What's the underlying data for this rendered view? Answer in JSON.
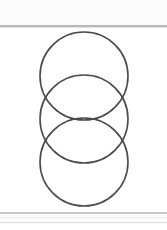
{
  "page": {
    "width": 167,
    "height": 230,
    "background_color": "#ffffff"
  },
  "top_band": {
    "background_color": "#fbfbfb",
    "rule_color": "#b9b9b9"
  },
  "bottom_band": {
    "background_color": "#fcfcfc",
    "rule_color": "#c9c9c9"
  },
  "figure": {
    "title": "",
    "stroke_color": "#4a4a4a",
    "fill": "none",
    "stroke_width": 1.6,
    "shape_count": 3,
    "shapes": [
      {
        "name": "circle-top",
        "type": "circle",
        "cx": 84,
        "cy": 76,
        "r": 44
      },
      {
        "name": "circle-middle",
        "type": "circle",
        "cx": 84,
        "cy": 119,
        "r": 44
      },
      {
        "name": "circle-bottom",
        "type": "circle",
        "cx": 84,
        "cy": 162,
        "r": 44
      }
    ]
  }
}
